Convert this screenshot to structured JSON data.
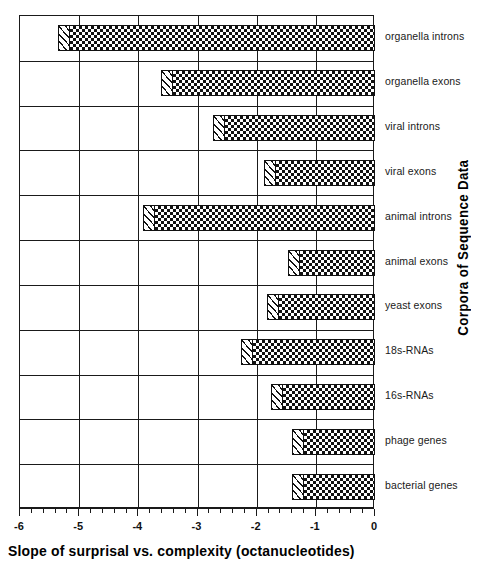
{
  "chart_data": {
    "type": "bar",
    "orientation": "horizontal",
    "title": "",
    "xlabel": "Slope of surprisal vs. complexity (octanucleotides)",
    "ylabel": "Corpora of Sequence Data",
    "xlim": [
      -6,
      0
    ],
    "grid": true,
    "legend": "none",
    "xticks": [
      "-6",
      "-5",
      "-4",
      "-3",
      "-2",
      "-1",
      "0"
    ],
    "xtick_values": [
      -6,
      -5,
      -4,
      -3,
      -2,
      -1,
      0
    ],
    "minor_ticks_per_interval": 5,
    "categories": [
      "organella introns",
      "organella exons",
      "viral introns",
      "viral exons",
      "animal introns",
      "animal exons",
      "yeast exons",
      "18s-RNAs",
      "16s-RNAs",
      "phage genes",
      "bacterial genes"
    ],
    "values": [
      -5.35,
      -3.61,
      -2.74,
      -1.88,
      -3.92,
      -1.47,
      -1.82,
      -2.26,
      -1.76,
      -1.4,
      -1.4
    ],
    "bar_fill": "checkerboard-hatch",
    "bar_cap_fill": "diagonal-hatch",
    "bar_edge_color": "#111111",
    "background_color": "#ffffff"
  }
}
